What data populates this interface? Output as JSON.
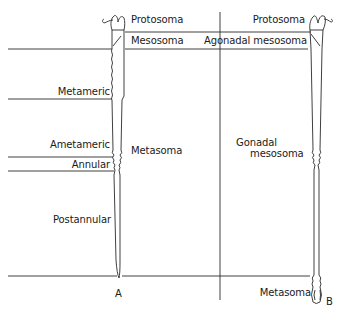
{
  "figure": {
    "panel_a": {
      "id_label": "A",
      "regions_top": [
        {
          "label": "Protosoma"
        },
        {
          "label": "Mesosoma"
        }
      ],
      "metasoma_label": "Metasoma",
      "subregions": [
        {
          "label": "Metameric"
        },
        {
          "label": "Ametameric"
        },
        {
          "label": "Annular"
        },
        {
          "label": "Postannular"
        }
      ]
    },
    "panel_b": {
      "id_label": "B",
      "regions_top": [
        {
          "label": "Protosoma"
        },
        {
          "label": "Agonadal mesosoma"
        }
      ],
      "gonadal_label_line1": "Gonadal",
      "gonadal_label_line2": "mesosoma",
      "bottom_label": "Metasoma"
    },
    "line_color": "#2a2a2a"
  }
}
